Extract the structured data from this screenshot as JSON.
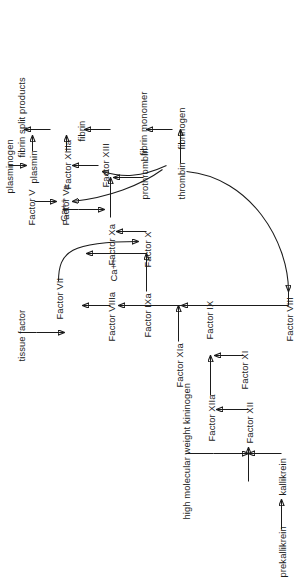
{
  "diagram": {
    "orientation": "rotated-90-ccw",
    "stroke_color": "#1b1b1b",
    "background_color": "#ffffff",
    "nodes": {
      "prekallikrein": "prekallikrein",
      "kallikrein": "kallikrein",
      "hmwk": "high molecular weight kininogen",
      "factor_xii": "Factor XII",
      "factor_xiia": "Factor XIIa",
      "factor_xi": "Factor XI",
      "factor_xia": "Factor XIa",
      "factor_ix": "Factor IX",
      "factor_ixa": "Factor IXa",
      "factor_viii": "Factor VIII",
      "factor_viiia": "Factor VIIIa",
      "calcium_1": "Ca++",
      "factor_x_1": "Factor X",
      "factor_xa": "Factor Xa",
      "factor_vii": "Factor VII",
      "tissue_factor": "tissue factor",
      "calcium_2": "Ca++",
      "prothrombin": "prothrombin",
      "thrombin": "thrombin",
      "factor_v": "Factor V",
      "factor_va": "Factor Va",
      "factor_xiii": "Factor XIII",
      "factor_xiiia": "Factor XIIIa",
      "fibrinogen": "fibrinogen",
      "fibrin_monomer": "fibrin monomer",
      "fibrin": "fibrin",
      "plasminogen": "plasminogen",
      "plasmin": "plasmin",
      "fibrin_split_products": "fibrin split products"
    },
    "edges": [
      {
        "from": "prekallikrein",
        "to": "kallikrein",
        "style": "arrow"
      },
      {
        "from": "kallikrein",
        "to": "factor_xii",
        "style": "arrow"
      },
      {
        "from": "hmwk",
        "to": "factor_xii",
        "style": "arrow"
      },
      {
        "from": "factor_xii",
        "to": "factor_xiia",
        "style": "arrow"
      },
      {
        "from": "factor_xiia",
        "to": "factor_xi",
        "style": "arrow"
      },
      {
        "from": "factor_xi",
        "to": "factor_xia",
        "style": "arrow"
      },
      {
        "from": "factor_xia",
        "to": "factor_ix",
        "style": "arrow"
      },
      {
        "from": "factor_ix",
        "to": "factor_ixa",
        "style": "arrow"
      },
      {
        "from": "factor_ixa",
        "to": "factor_x_1",
        "style": "arrow"
      },
      {
        "from": "factor_viii",
        "to": "factor_viiia",
        "style": "arrow"
      },
      {
        "from": "factor_viiia",
        "to": "factor_x_1",
        "style": "arrow"
      },
      {
        "from": "factor_vii",
        "to": "factor_x_1",
        "style": "curved-arrow"
      },
      {
        "from": "tissue_factor",
        "to": "factor_vii",
        "style": "arrow"
      },
      {
        "from": "factor_x_1",
        "to": "factor_xa",
        "style": "arrow"
      },
      {
        "from": "factor_xa",
        "to": "prothrombin",
        "style": "arrow"
      },
      {
        "from": "calcium_2",
        "to": "prothrombin",
        "style": "arrow"
      },
      {
        "from": "prothrombin",
        "to": "thrombin",
        "style": "arrow"
      },
      {
        "from": "thrombin",
        "to": "factor_viii",
        "style": "curved-arrow"
      },
      {
        "from": "thrombin",
        "to": "factor_va",
        "style": "curved-arrow"
      },
      {
        "from": "thrombin",
        "to": "factor_xiiia",
        "style": "curved-arrow"
      },
      {
        "from": "factor_v",
        "to": "factor_va",
        "style": "arrow"
      },
      {
        "from": "thrombin",
        "to": "fibrinogen",
        "style": "arrow"
      },
      {
        "from": "fibrinogen",
        "to": "fibrin_monomer",
        "style": "arrow"
      },
      {
        "from": "fibrin_monomer",
        "to": "fibrin",
        "style": "arrow"
      },
      {
        "from": "factor_xiiia",
        "to": "fibrin",
        "style": "arrow"
      },
      {
        "from": "fibrin",
        "to": "fibrin_split_products",
        "style": "arrow"
      },
      {
        "from": "plasminogen",
        "to": "plasmin",
        "style": "arrow"
      },
      {
        "from": "plasmin",
        "to": "fibrin_split_products",
        "style": "arrow"
      }
    ]
  }
}
